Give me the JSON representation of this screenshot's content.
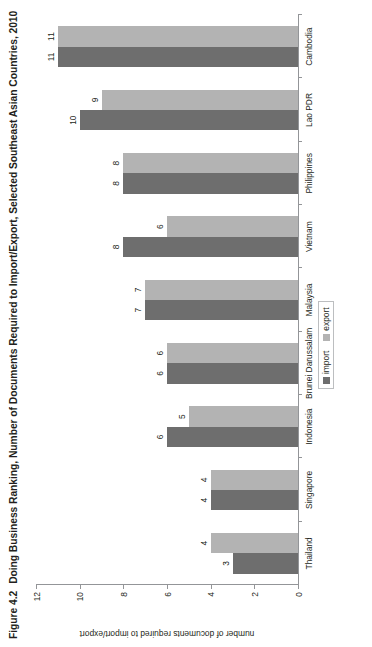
{
  "figure": {
    "label": "Figure 4.2",
    "title": "Doing Business Ranking, Number of Documents Required to Import/Export, Selected Southeast Asian Countries, 2010"
  },
  "legend": {
    "items": [
      {
        "name": "import",
        "label": "import",
        "color": "#6e6e6e"
      },
      {
        "name": "export",
        "label": "export",
        "color": "#b3b3b3"
      }
    ]
  },
  "axis": {
    "value_title": "number of documents required to import/export",
    "ticks": [
      "0",
      "2",
      "4",
      "6",
      "8",
      "10",
      "12"
    ]
  },
  "chart_data": {
    "type": "bar",
    "title": "Doing Business Ranking, Number of Documents Required to Import/Export, Selected Southeast Asian Countries, 2010",
    "xlabel": "",
    "ylabel": "number of documents required to import/export",
    "ylim": [
      0,
      12
    ],
    "ytick_step": 2,
    "grid": false,
    "legend_position": "bottom-right",
    "orientation": "vertical-bars-in-rotated-page",
    "categories": [
      "Thailand",
      "Singapore",
      "Indonesia",
      "Brunei Darussalam",
      "Malaysia",
      "Vietnam",
      "Philippines",
      "Lao PDR",
      "Cambodia"
    ],
    "series": [
      {
        "name": "import",
        "color": "#6e6e6e",
        "values": [
          3,
          4,
          6,
          6,
          7,
          8,
          8,
          10,
          11
        ]
      },
      {
        "name": "export",
        "color": "#b3b3b3",
        "values": [
          4,
          4,
          5,
          6,
          7,
          6,
          8,
          9,
          11
        ]
      }
    ]
  }
}
